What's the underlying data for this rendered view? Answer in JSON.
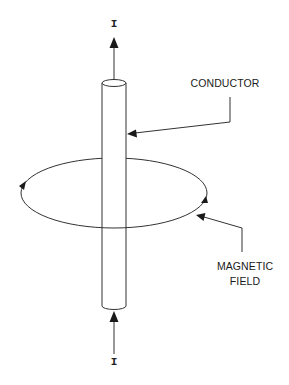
{
  "diagram": {
    "type": "magnetic field around current-carrying conductor",
    "labels": {
      "conductor": "CONDUCTOR",
      "magnetic_field_line1": "MAGNETIC",
      "magnetic_field_line2": "FIELD",
      "current_top": "I",
      "current_bottom": "I"
    },
    "colors": {
      "stroke": "#333333",
      "background": "#ffffff"
    }
  }
}
